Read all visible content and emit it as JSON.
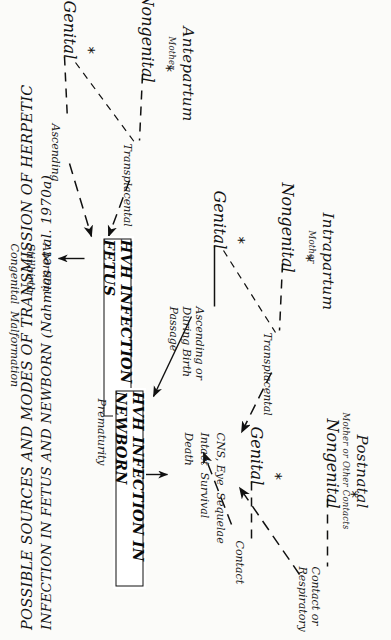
{
  "figure": {
    "title_line1": "POSSIBLE SOURCES AND MODES OF TRANSMISSION OF HERPETIC",
    "title_line2": "INFECTION IN FETUS AND NEWBORN (Nahmias et al. 1970a)",
    "ink_color": "#111111",
    "paper_color": "#fbfbf9"
  },
  "columns": [
    {
      "id": "antepartum",
      "header": "Antepartum",
      "subheader": "Mother",
      "nodes": [
        {
          "label": "Genital",
          "marker": "*"
        },
        {
          "label": "Nongenital",
          "marker": "*"
        }
      ],
      "edge_labels": [
        "Ascending",
        "Transplacental"
      ]
    },
    {
      "id": "intrapartum",
      "header": "Intrapartum",
      "subheader": "Mother",
      "nodes": [
        {
          "label": "Genital",
          "marker": "*"
        },
        {
          "label": "Nongenital",
          "marker": "*"
        }
      ],
      "edge_labels": [
        "Ascending or\nDuring Birth\nPassage",
        "Transplacental"
      ]
    },
    {
      "id": "postnatal",
      "header": "Postnatal",
      "subheader": "Mother or Other Contacts",
      "nodes": [
        {
          "label": "Genital",
          "marker": "*"
        },
        {
          "label": "Nongenital",
          "marker": "*"
        }
      ],
      "edge_labels": [
        "Contact",
        "Contact or\nRespiratory"
      ]
    }
  ],
  "boxes": [
    {
      "id": "fetus",
      "label": "HVH INFECTION IN FETUS"
    },
    {
      "id": "newborn",
      "label": "HVH INFECTION IN NEWBORN"
    }
  ],
  "outcomes": {
    "fetus": [
      "Abortion",
      "Stillbirth",
      "Congenital  Malformation"
    ],
    "newborn": [
      "Death",
      "Intact  Survival",
      "CNS, Eye  Sequelae"
    ],
    "newborn_side_label": "Prematurity"
  }
}
